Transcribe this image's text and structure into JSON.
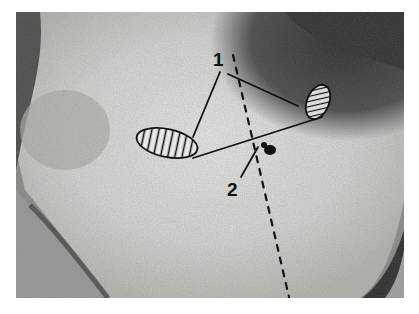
{
  "figure": {
    "type": "annotated grayscale photograph",
    "labels": [
      {
        "id": "label-1",
        "text": "1",
        "x": 218,
        "y": 66
      },
      {
        "id": "label-2",
        "text": "2",
        "x": 234,
        "y": 196
      }
    ],
    "annotations": {
      "hatched_regions": [
        {
          "name": "left-hatched-region",
          "cx": 167,
          "cy": 143,
          "rx": 31,
          "ry": 14,
          "rotate": 12,
          "hatch": "vertical"
        },
        {
          "name": "right-hatched-region",
          "cx": 318,
          "cy": 102,
          "rx": 11,
          "ry": 18,
          "rotate": 22,
          "hatch": "diagonal"
        }
      ],
      "connecting_line": {
        "points": [
          [
            193,
            158
          ],
          [
            322,
            117
          ]
        ]
      },
      "leader_lines_label_1": [
        {
          "from": [
            220,
            72
          ],
          "to": [
            193,
            137
          ]
        },
        {
          "from": [
            228,
            74
          ],
          "to": [
            298,
            106
          ]
        }
      ],
      "leader_line_label_2": {
        "from": [
          241,
          177
        ],
        "to": [
          258,
          147
        ]
      },
      "dashed_line": {
        "from": [
          233,
          55
        ],
        "to": [
          289,
          297
        ]
      },
      "dark_spot": {
        "cx": 268,
        "cy": 148
      }
    },
    "colors": {
      "background": "#ffffff",
      "ink": "#111111",
      "skin_light": "#e6e6e2",
      "skin_mid": "#b5b5b0",
      "shadow": "#3a3a38"
    }
  }
}
